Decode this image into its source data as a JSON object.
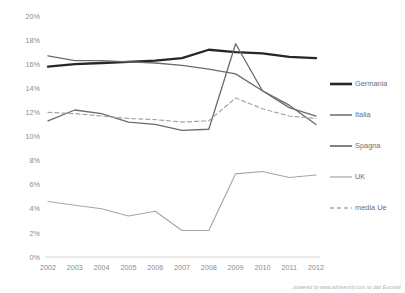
{
  "chart_data": {
    "type": "line",
    "title": "",
    "subtitle": "",
    "xlabel": "",
    "ylabel": "",
    "x": [
      "2002",
      "2003",
      "2004",
      "2005",
      "2006",
      "2007",
      "2008",
      "2009",
      "2010",
      "2011",
      "2012"
    ],
    "categories": [
      "2002",
      "2003",
      "2004",
      "2005",
      "2006",
      "2007",
      "2008",
      "2009",
      "2010",
      "2011",
      "2012"
    ],
    "ylim": [
      0,
      20
    ],
    "ytick_labels": [
      "0%",
      "2%",
      "4%",
      "6%",
      "8%",
      "10%",
      "12%",
      "14%",
      "16%",
      "18%",
      "20%"
    ],
    "ytick_values": [
      0,
      2,
      4,
      6,
      8,
      10,
      12,
      14,
      16,
      18,
      20
    ],
    "grid": false,
    "legend_position": "right",
    "series": [
      {
        "name": "Germania",
        "color": "#262626",
        "width": 2.3,
        "dash": "none",
        "values": [
          15.8,
          16.0,
          16.1,
          16.2,
          16.3,
          16.5,
          17.2,
          17.0,
          16.9,
          16.6,
          16.5
        ]
      },
      {
        "name": "Italia",
        "color": "#6b6b6b",
        "width": 1.3,
        "dash": "none",
        "values": [
          11.3,
          12.2,
          11.9,
          11.2,
          11.0,
          10.5,
          10.6,
          17.7,
          13.8,
          12.4,
          11.7
        ]
      },
      {
        "name": "Spagna",
        "color": "#6b6b6b",
        "width": 1.3,
        "dash": "none",
        "values": [
          16.7,
          16.3,
          16.3,
          16.2,
          16.1,
          15.9,
          15.6,
          15.2,
          13.8,
          12.6,
          11.0
        ]
      },
      {
        "name": "UK",
        "color": "#a6a6a6",
        "width": 1.1,
        "dash": "none",
        "values": [
          4.6,
          4.3,
          4.0,
          3.4,
          3.8,
          2.2,
          2.2,
          6.9,
          7.1,
          6.6,
          6.8
        ]
      },
      {
        "name": "media Ue",
        "color": "#a6a6a6",
        "width": 1.2,
        "dash": "4,3",
        "values": [
          12.0,
          11.9,
          11.7,
          11.5,
          11.4,
          11.2,
          11.3,
          13.2,
          12.3,
          11.7,
          11.5
        ]
      }
    ],
    "legend_entries": [
      {
        "label": "Germania",
        "color": "#262626",
        "width": 2.6,
        "dash": "none"
      },
      {
        "label": "Italia",
        "color": "#6b6b6b",
        "width": 1.5,
        "dash": "none"
      },
      {
        "label": "Spagna",
        "color": "#6b6b6b",
        "width": 1.7,
        "dash": "none"
      },
      {
        "label": "UK",
        "color": "#a6a6a6",
        "width": 1.2,
        "dash": "none"
      },
      {
        "label": "media Ue",
        "color": "#a6a6a6",
        "width": 1.3,
        "dash": "4,3"
      }
    ]
  },
  "footer": {
    "credit": "powered by  www.adviseonly.com su dati Eurostat"
  }
}
